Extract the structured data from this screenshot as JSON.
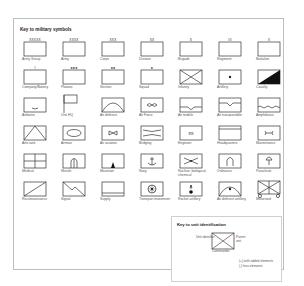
{
  "key": {
    "title": "Key to military symbols",
    "symbols": [
      {
        "id": "army-group",
        "label": "Army Group",
        "marker": "XXXXX",
        "glyph": "plain"
      },
      {
        "id": "army",
        "label": "Army",
        "marker": "XXXX",
        "glyph": "plain"
      },
      {
        "id": "corps",
        "label": "Corps",
        "marker": "XXX",
        "glyph": "plain"
      },
      {
        "id": "division",
        "label": "Division",
        "marker": "XX",
        "glyph": "plain"
      },
      {
        "id": "brigade",
        "label": "Brigade",
        "marker": "X",
        "glyph": "plain"
      },
      {
        "id": "regiment",
        "label": "Regiment",
        "marker": "III",
        "glyph": "plain"
      },
      {
        "id": "battalion",
        "label": "Battalion",
        "marker": "II",
        "glyph": "plain"
      },
      {
        "id": "company-battery",
        "label": "Company/Battery",
        "marker": "I",
        "glyph": "plain"
      },
      {
        "id": "platoon",
        "label": "Platoon",
        "marker": "●●●",
        "glyph": "plain"
      },
      {
        "id": "section",
        "label": "Section",
        "marker": "●●",
        "glyph": "plain"
      },
      {
        "id": "squad",
        "label": "Squad",
        "marker": "●",
        "glyph": "plain"
      },
      {
        "id": "infantry",
        "label": "Infantry",
        "marker": "",
        "glyph": "cross"
      },
      {
        "id": "artillery",
        "label": "Artillery",
        "marker": "",
        "glyph": "dot"
      },
      {
        "id": "cavalry",
        "label": "Cavalry",
        "marker": "",
        "glyph": "half-diagonal"
      },
      {
        "id": "airborne",
        "label": "Airborne",
        "marker": "",
        "glyph": "airborne"
      },
      {
        "id": "unit-hq",
        "label": "Unit HQ",
        "marker": "",
        "glyph": "flag"
      },
      {
        "id": "air-defence",
        "label": "Air defence",
        "marker": "",
        "glyph": "arc"
      },
      {
        "id": "air-force",
        "label": "Air Force",
        "marker": "",
        "glyph": "propeller"
      },
      {
        "id": "air-mobile",
        "label": "Air mobile",
        "marker": "",
        "glyph": "airmobile"
      },
      {
        "id": "air-transportable",
        "label": "Air transportable",
        "marker": "",
        "glyph": "airtransport"
      },
      {
        "id": "amphibious",
        "label": "Amphibious",
        "marker": "",
        "glyph": "wave"
      },
      {
        "id": "anti-tank",
        "label": "Anti-tank",
        "marker": "",
        "glyph": "chevron"
      },
      {
        "id": "armour",
        "label": "Armour",
        "marker": "",
        "glyph": "oval"
      },
      {
        "id": "air-aviation",
        "label": "Air aviation",
        "marker": "",
        "glyph": "bowtie"
      },
      {
        "id": "bridging",
        "label": "Bridging",
        "marker": "",
        "glyph": "bridge"
      },
      {
        "id": "engineer",
        "label": "Engineer",
        "marker": "",
        "glyph": "m"
      },
      {
        "id": "headquarters",
        "label": "Headquarters",
        "marker": "",
        "glyph": "hq-line"
      },
      {
        "id": "maintenance",
        "label": "Maintenance",
        "marker": "",
        "glyph": "wrench"
      },
      {
        "id": "medical",
        "label": "Medical",
        "marker": "",
        "glyph": "medical"
      },
      {
        "id": "missile",
        "label": "Missile",
        "marker": "",
        "glyph": "missile"
      },
      {
        "id": "mountain",
        "label": "Mountain",
        "marker": "",
        "glyph": "mountain"
      },
      {
        "id": "navy",
        "label": "Navy",
        "marker": "",
        "glyph": "anchor"
      },
      {
        "id": "nbc",
        "label": "Nuclear, biological, chemical",
        "marker": "",
        "glyph": "nbc"
      },
      {
        "id": "ordnance",
        "label": "Ordnance",
        "marker": "",
        "glyph": "ordnance"
      },
      {
        "id": "parachute",
        "label": "Parachute",
        "marker": "",
        "glyph": "parachute"
      },
      {
        "id": "reconnaissance",
        "label": "Reconnaissance",
        "marker": "",
        "glyph": "diag-up"
      },
      {
        "id": "signal",
        "label": "Signal",
        "marker": "",
        "glyph": "signal"
      },
      {
        "id": "supply",
        "label": "Supply",
        "marker": "",
        "glyph": "supply"
      },
      {
        "id": "transport-movement",
        "label": "Transport movement",
        "marker": "",
        "glyph": "wheel"
      },
      {
        "id": "rocket-artillery",
        "label": "Rocket artillery",
        "marker": "",
        "glyph": "rocket"
      },
      {
        "id": "air-defence-artillery",
        "label": "Air defence artillery",
        "marker": "",
        "glyph": "arc-dot"
      },
      {
        "id": "motorised",
        "label": "Motorised",
        "marker": "",
        "glyph": "motorised"
      }
    ]
  },
  "unit_identification": {
    "title": "Key to unit identification",
    "unit_identifier": "Unit identifier",
    "parent_unit": "Parent unit",
    "commander": "Commander",
    "note_plus": "(+) with added elements",
    "note_minus": "(-) less elements"
  }
}
